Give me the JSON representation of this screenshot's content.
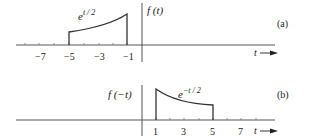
{
  "panel_a": {
    "tag": "(a)",
    "ylabel": "f (t)",
    "xlabel": "t",
    "curve_label_base": "e",
    "curve_label_exp": "t / 2",
    "ticks": [
      "−7",
      "−5",
      "−3",
      "−1"
    ]
  },
  "panel_b": {
    "tag": "(b)",
    "ylabel": "f (−t)",
    "xlabel": "t",
    "curve_label_base": "e",
    "curve_label_exp": "−t / 2",
    "ticks": [
      "1",
      "3",
      "5",
      "7"
    ]
  },
  "colors": {
    "line": "#333333",
    "text": "#222222"
  }
}
